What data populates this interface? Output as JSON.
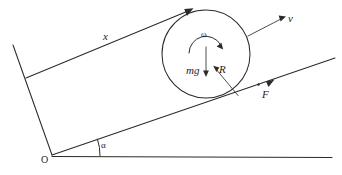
{
  "figure": {
    "background_color": "#ffffff",
    "stroke_color": "#2b2b2b",
    "width": 342,
    "height": 175
  },
  "labels": {
    "displacement": "x",
    "velocity": "v",
    "angular_velocity": "ω",
    "weight": "mg",
    "radius": "R",
    "friction_force": "F",
    "incline_angle": "α",
    "origin": "O"
  },
  "geometry": {
    "origin_point": {
      "x": 52,
      "y": 155
    },
    "incline_angle_degrees": 19,
    "incline_line": {
      "x1": 52,
      "y1": 155,
      "x2": 335,
      "y2": 58
    },
    "ground_line": {
      "x1": 52,
      "y1": 157,
      "x2": 332,
      "y2": 157
    },
    "upper_parallel_line": {
      "x1": 26,
      "y1": 78,
      "x2": 193,
      "y2": 9
    },
    "left_edge_line": {
      "x1": 13,
      "y1": 45,
      "x2": 52,
      "y2": 155
    },
    "circle": {
      "cx": 206,
      "cy": 54,
      "r": 44
    },
    "contact_point": {
      "x": 238,
      "y": 95
    },
    "angle_arc_radius": 48
  },
  "arrows": [
    {
      "name": "x-arrow",
      "label": "x",
      "direction": "up-right",
      "tip": {
        "x": 193,
        "y": 9
      }
    },
    {
      "name": "v-arrow",
      "label": "v",
      "direction": "up-right",
      "tip": {
        "x": 285,
        "y": 17
      }
    },
    {
      "name": "F-arrow",
      "label": "F",
      "direction": "up-right",
      "tip": {
        "x": 272,
        "y": 81
      }
    },
    {
      "name": "mg-arrow",
      "label": "mg",
      "direction": "down",
      "tip": {
        "x": 206,
        "y": 77
      }
    },
    {
      "name": "omega-arc-arrow",
      "label": "ω",
      "direction": "clockwise",
      "tip": {
        "x": 222,
        "y": 48
      }
    }
  ]
}
